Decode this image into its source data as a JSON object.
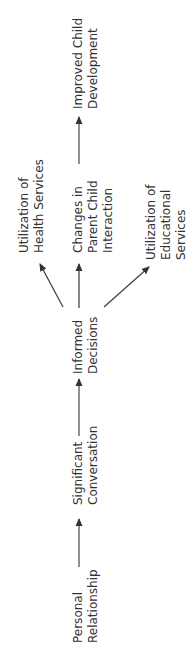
{
  "diagram": {
    "orientation": "rotated-90-ccw",
    "line_color": "#444444",
    "text_color": "#333333",
    "nodes": [
      {
        "id": "personal",
        "lines": [
          "Personal",
          "Relationship"
        ]
      },
      {
        "id": "conversation",
        "lines": [
          "Significant",
          "Conversation"
        ]
      },
      {
        "id": "decisions",
        "lines": [
          "Informed",
          "Decisions"
        ]
      },
      {
        "id": "health",
        "lines": [
          "Utilization of",
          "Health Services"
        ]
      },
      {
        "id": "parent",
        "lines": [
          "Changes in",
          "Parent Child",
          "Interaction"
        ]
      },
      {
        "id": "education",
        "lines": [
          "Utilization of",
          "Educational",
          "Services"
        ]
      },
      {
        "id": "development",
        "lines": [
          "Improved Child",
          "Development"
        ]
      }
    ],
    "edges": [
      {
        "from": "personal",
        "to": "conversation"
      },
      {
        "from": "conversation",
        "to": "decisions"
      },
      {
        "from": "decisions",
        "to": "health"
      },
      {
        "from": "decisions",
        "to": "parent"
      },
      {
        "from": "decisions",
        "to": "education"
      },
      {
        "from": "parent",
        "to": "development"
      }
    ]
  }
}
